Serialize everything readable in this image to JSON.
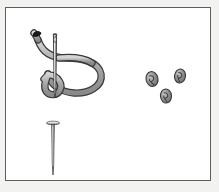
{
  "scene": {
    "title": "Sewing needle with threaded loop, straight pin and three knots",
    "canvas_width": 219,
    "canvas_height": 192,
    "outer_background": "#f2f2f0",
    "paper_background": "#ffffff",
    "frame": {
      "x": 5,
      "y": 7,
      "width": 206,
      "height": 174,
      "border_color": "#5e5e5e",
      "border_width": 1
    }
  },
  "palette": {
    "thread_fill": "#a8a8a8",
    "thread_outline": "#3a3a3a",
    "thread_highlight": "#cfcfcf",
    "thread_tip_dark": "#1c1c1c",
    "needle_body": "#8f8f8f",
    "needle_outline": "#2e2e2e",
    "needle_highlight": "#e6e6e6",
    "pin_body": "#9a9a9a",
    "pin_outline": "#303030",
    "pin_head": "#b5b5b5",
    "knot_fill": "#8c8c8c",
    "knot_outline": "#3c3c3c",
    "knot_inner": "#cdcdcd"
  },
  "objects": {
    "threaded_needle": {
      "label": "Threaded sewing needle with looped thread",
      "needle": {
        "label": "Sewing needle",
        "top_x": 55,
        "top_y": 35,
        "bottom_x": 55,
        "bottom_y": 97,
        "eye_y": 40,
        "width": 3
      },
      "thread": {
        "label": "Thread forming a large loop and a small loop",
        "free_end_x": 33,
        "free_end_y": 33,
        "stroke_width": 5,
        "big_loop_center_x": 80,
        "big_loop_center_y": 68,
        "big_loop_radius": 23,
        "small_loop_center_x": 53,
        "small_loop_center_y": 85,
        "small_loop_radius": 10
      }
    },
    "straight_pin": {
      "label": "Straight pin",
      "head_x": 53,
      "head_y": 122,
      "head_width": 13,
      "tip_x": 53,
      "tip_y": 174,
      "shaft_width": 2
    },
    "knots": [
      {
        "label": "Knot one",
        "cx": 152,
        "cy": 79,
        "rx": 6,
        "ry": 7.5,
        "rotation": -12
      },
      {
        "label": "Knot two",
        "cx": 180,
        "cy": 76,
        "rx": 5.5,
        "ry": 7,
        "rotation": 8
      },
      {
        "label": "Knot three",
        "cx": 166,
        "cy": 96,
        "rx": 5.5,
        "ry": 7,
        "rotation": -5
      }
    ]
  }
}
